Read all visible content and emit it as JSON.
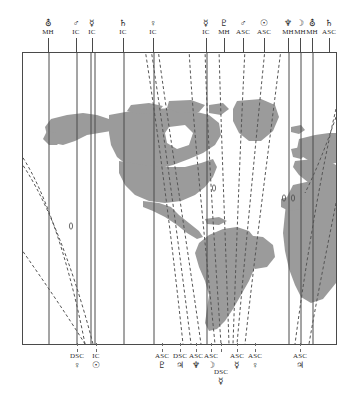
{
  "chart_data": {
    "type": "map",
    "projection": "equirectangular",
    "lon_range": [
      -180,
      60
    ],
    "lat_range": [
      -60,
      80
    ],
    "grid": false,
    "legend": "none",
    "xlabel": "",
    "ylabel": "",
    "land_color": "#9b9b9b",
    "mc_ic_line_color": "#4a4a4a",
    "asc_dsc_line_color": "#555555",
    "top_labels": [
      {
        "glyph": "⛢",
        "planet": "Uranus",
        "angle": "MH",
        "x": 48
      },
      {
        "glyph": "♂",
        "planet": "Mars",
        "angle": "IC",
        "x": 76
      },
      {
        "glyph": "☿",
        "planet": "Mercury",
        "angle": "IC",
        "x": 92
      },
      {
        "glyph": "♄",
        "planet": "Saturn",
        "angle": "IC",
        "x": 123
      },
      {
        "glyph": "♀",
        "planet": "Venus",
        "angle": "IC",
        "x": 153
      },
      {
        "glyph": "☿",
        "planet": "Mercury",
        "angle": "IC",
        "x": 206
      },
      {
        "glyph": "♇",
        "planet": "Pluto",
        "angle": "MH",
        "x": 224
      },
      {
        "glyph": "♂",
        "planet": "Mars",
        "angle": "ASC",
        "x": 243
      },
      {
        "glyph": "☉",
        "planet": "Sun",
        "angle": "ASC",
        "x": 264
      },
      {
        "glyph": "♆",
        "planet": "Neptune",
        "angle": "MH",
        "x": 288
      },
      {
        "glyph": "☽",
        "planet": "Moon",
        "angle": "MH",
        "x": 300
      },
      {
        "glyph": "⛢",
        "planet": "Uranus",
        "angle": "MH",
        "x": 312
      },
      {
        "glyph": "♄",
        "planet": "Saturn",
        "angle": "ASC",
        "x": 329
      }
    ],
    "bottom_labels": [
      {
        "glyph": "♀",
        "planet": "Venus",
        "angle": "DSC",
        "x": 77,
        "row": 0
      },
      {
        "glyph": "☉",
        "planet": "Sun",
        "angle": "IC",
        "x": 96,
        "row": 0
      },
      {
        "glyph": "♇",
        "planet": "Pluto",
        "angle": "ASC",
        "x": 162,
        "row": 0
      },
      {
        "glyph": "♃",
        "planet": "Jupiter",
        "angle": "DSC",
        "x": 180,
        "row": 0
      },
      {
        "glyph": "♆",
        "planet": "Neptune",
        "angle": "ASC",
        "x": 196,
        "row": 0
      },
      {
        "glyph": "☽",
        "planet": "Moon",
        "angle": "ASC",
        "x": 211,
        "row": 0
      },
      {
        "glyph": "☿",
        "planet": "Mercury",
        "angle": "DSC",
        "x": 221,
        "row": 1
      },
      {
        "glyph": "☿",
        "planet": "Mercury",
        "angle": "ASC",
        "x": 237,
        "row": 0
      },
      {
        "glyph": "♀",
        "planet": "Venus",
        "angle": "ASC",
        "x": 255,
        "row": 0
      },
      {
        "glyph": "♃",
        "planet": "Jupiter",
        "angle": "ASC",
        "x": 300,
        "row": 0
      }
    ],
    "mc_ic_lines_x": [
      48,
      76,
      90,
      94,
      123,
      153,
      206,
      288,
      300,
      312
    ],
    "asc_dsc_curves": [
      "Mars ASC",
      "Sun ASC",
      "Saturn ASC",
      "Venus DSC",
      "Pluto ASC",
      "Jupiter DSC",
      "Neptune ASC",
      "Moon ASC",
      "Mercury DSC",
      "Mercury ASC",
      "Venus ASC",
      "Jupiter ASC"
    ]
  }
}
